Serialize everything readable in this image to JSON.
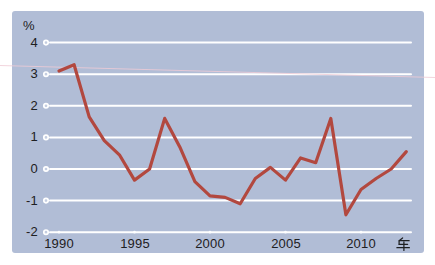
{
  "chart_data": {
    "type": "line",
    "title": "",
    "unit_label": "%",
    "xlabel": "年",
    "x": [
      1990,
      1991,
      1992,
      1993,
      1994,
      1995,
      1996,
      1997,
      1998,
      1999,
      2000,
      2001,
      2002,
      2003,
      2004,
      2005,
      2006,
      2007,
      2008,
      2009,
      2010,
      2011,
      2012,
      2013
    ],
    "values": [
      3.1,
      3.3,
      1.65,
      0.9,
      0.45,
      -0.35,
      0.0,
      1.6,
      0.7,
      -0.4,
      -0.85,
      -0.9,
      -1.1,
      -0.3,
      0.05,
      -0.35,
      0.35,
      0.2,
      1.6,
      -1.45,
      -0.65,
      -0.3,
      0.0,
      0.55
    ],
    "x_ticks": [
      1990,
      1995,
      2000,
      2005,
      2010
    ],
    "y_ticks": [
      4,
      3,
      2,
      1,
      0,
      -1,
      -2
    ],
    "ylim": [
      -2,
      4
    ],
    "xlim": [
      1990,
      2013
    ],
    "grid": "horizontal white gridlines with open-circle left caps and small dots on baseline at 5-year ticks",
    "legend": "none",
    "colors": {
      "line": "#b2483f",
      "panel_background": "#b1bdd6",
      "page_background": "#ffffff",
      "gridline": "#ffffff",
      "text": "#1e2022",
      "scan_artifact": "#f0ccd6"
    }
  }
}
